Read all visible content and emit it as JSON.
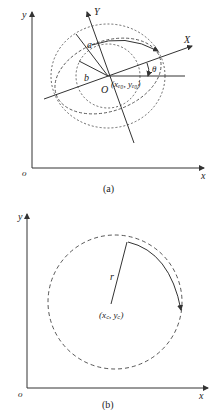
{
  "figure_a": {
    "caption": "(a)",
    "axis_x_label": "x",
    "axis_y_label": "y",
    "origin_label": "o",
    "rotated_x_label": "X",
    "rotated_y_label": "Y",
    "semi_major_label": "a",
    "semi_minor_label": "b",
    "center_label": "O",
    "center_coords_label": "(xₑ₀, yₑ₀)",
    "angle_label": "θ"
  },
  "figure_b": {
    "caption": "(b)",
    "axis_x_label": "x",
    "axis_y_label": "y",
    "origin_label": "o",
    "radius_label": "r",
    "center_coords_label": "(x꜀, y꜀)"
  },
  "colors": {
    "stroke": "#333333",
    "background": "#ffffff"
  }
}
